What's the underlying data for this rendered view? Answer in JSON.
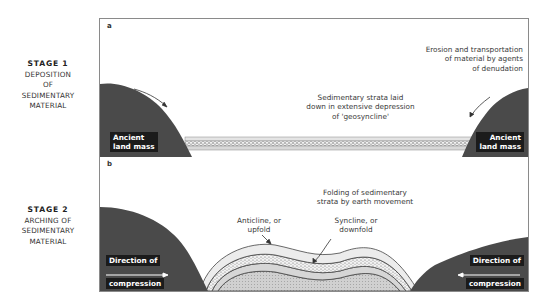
{
  "stages": [
    {
      "title": "STAGE 1",
      "lines": [
        "DEPOSITION",
        "OF",
        "SEDIMENTARY",
        "MATERIAL"
      ]
    },
    {
      "title": "STAGE 2",
      "lines": [
        "ARCHING OF",
        "SEDIMENTARY",
        "MATERIAL"
      ]
    }
  ],
  "panel_a": {
    "letter": "a",
    "left_landmass_label": [
      "Ancient",
      "land mass"
    ],
    "right_landmass_label": [
      "Ancient",
      "land mass"
    ],
    "strata_caption": [
      "Sedimentary strata laid",
      "down in extensive depression",
      "of 'geosyncline'"
    ],
    "erosion_caption": [
      "Erosion and transportation",
      "of material by agents",
      "of denudation"
    ]
  },
  "panel_b": {
    "letter": "b",
    "folding_caption": [
      "Folding of sedimentary",
      "strata by earth movement"
    ],
    "anticline_caption": [
      "Anticline, or",
      "upfold"
    ],
    "syncline_caption": [
      "Syncline, or",
      "downfold"
    ],
    "left_compression_label": [
      "Direction of",
      "compression"
    ],
    "right_compression_label": [
      "Direction of",
      "compression"
    ]
  },
  "colors": {
    "landmass": "#4a4a4a",
    "label_bg": "#1b1b1b",
    "strata_light": "#d9d9d9",
    "strata_dotted": "#f0f0f0",
    "frame": "#8a8a8a"
  }
}
